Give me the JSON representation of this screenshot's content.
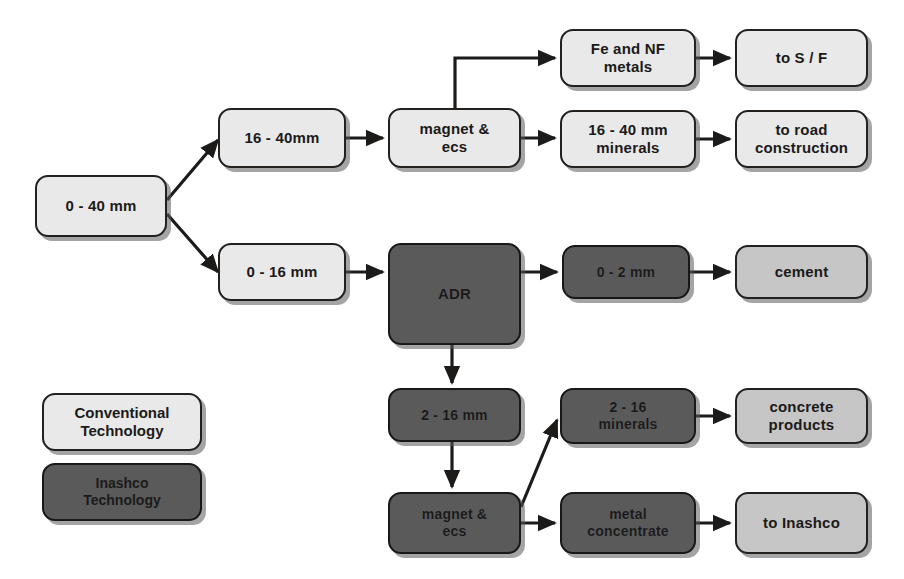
{
  "diagram": {
    "colors": {
      "light_fill": "#e9e9e9",
      "midlight_fill": "#c6c6c6",
      "dark_fill": "#5a5a5a",
      "stroke": "#23201e",
      "background": "#ffffff"
    },
    "nodes": [
      {
        "id": "feed",
        "label": "0 - 40 mm",
        "style": "light",
        "x": 35,
        "y": 175,
        "w": 132,
        "h": 62,
        "font": 15
      },
      {
        "id": "frac_16_40",
        "label": "16 - 40mm",
        "style": "light",
        "x": 218,
        "y": 108,
        "w": 128,
        "h": 60,
        "font": 15
      },
      {
        "id": "magnet_ecs_top",
        "label": "magnet &\necs",
        "style": "light",
        "x": 388,
        "y": 108,
        "w": 133,
        "h": 60,
        "font": 15
      },
      {
        "id": "fe_nf_metals",
        "label": "Fe and NF\nmetals",
        "style": "light",
        "x": 560,
        "y": 29,
        "w": 136,
        "h": 58,
        "font": 15
      },
      {
        "id": "to_sf",
        "label": "to S / F",
        "style": "light",
        "x": 735,
        "y": 29,
        "w": 133,
        "h": 58,
        "font": 15
      },
      {
        "id": "min_16_40",
        "label": "16 - 40 mm\nminerals",
        "style": "light",
        "x": 560,
        "y": 110,
        "w": 136,
        "h": 58,
        "font": 15
      },
      {
        "id": "to_road",
        "label": "to road\nconstruction",
        "style": "light",
        "x": 735,
        "y": 110,
        "w": 133,
        "h": 58,
        "font": 15
      },
      {
        "id": "frac_0_16",
        "label": "0 - 16 mm",
        "style": "light",
        "x": 218,
        "y": 243,
        "w": 128,
        "h": 58,
        "font": 15
      },
      {
        "id": "adr",
        "label": "ADR",
        "style": "dark",
        "x": 388,
        "y": 243,
        "w": 133,
        "h": 102,
        "font": 15
      },
      {
        "id": "frac_0_2",
        "label": "0 - 2 mm",
        "style": "dark",
        "x": 562,
        "y": 245,
        "w": 128,
        "h": 54,
        "font": 14
      },
      {
        "id": "cement",
        "label": "cement",
        "style": "midlight",
        "x": 735,
        "y": 245,
        "w": 133,
        "h": 54,
        "font": 15
      },
      {
        "id": "frac_2_16",
        "label": "2 - 16 mm",
        "style": "dark",
        "x": 388,
        "y": 388,
        "w": 133,
        "h": 54,
        "font": 14
      },
      {
        "id": "magnet_ecs_bot",
        "label": "magnet &\necs",
        "style": "dark",
        "x": 388,
        "y": 492,
        "w": 133,
        "h": 62,
        "font": 14
      },
      {
        "id": "min_2_16",
        "label": "2 - 16\nminerals",
        "style": "dark",
        "x": 560,
        "y": 388,
        "w": 136,
        "h": 56,
        "font": 14
      },
      {
        "id": "concrete",
        "label": "concrete\nproducts",
        "style": "midlight",
        "x": 735,
        "y": 388,
        "w": 133,
        "h": 56,
        "font": 15
      },
      {
        "id": "metal_conc",
        "label": "metal\nconcentrate",
        "style": "dark",
        "x": 560,
        "y": 492,
        "w": 136,
        "h": 62,
        "font": 14
      },
      {
        "id": "to_inashco",
        "label": "to Inashco",
        "style": "midlight",
        "x": 735,
        "y": 492,
        "w": 133,
        "h": 62,
        "font": 15
      }
    ],
    "legend": [
      {
        "id": "legend-conventional",
        "label": "Conventional\nTechnology",
        "style": "light",
        "x": 42,
        "y": 393,
        "w": 160,
        "h": 58,
        "font": 15
      },
      {
        "id": "legend-inashco",
        "label": "Inashco\nTechnology",
        "style": "dark",
        "x": 42,
        "y": 463,
        "w": 160,
        "h": 58,
        "font": 14
      }
    ],
    "connectors": [
      {
        "id": "feed-to-16-40",
        "points": "167,200 218,140",
        "arrow": true
      },
      {
        "id": "feed-to-0-16",
        "points": "167,214 218,272",
        "arrow": true
      },
      {
        "id": "16-40-to-magnet",
        "points": "346,138 383,138",
        "arrow": true
      },
      {
        "id": "magnet-to-fe-nf",
        "points": "455,108 455,58 555,58",
        "arrow": true
      },
      {
        "id": "magnet-to-minerals",
        "points": "521,138 555,138",
        "arrow": true
      },
      {
        "id": "fe-nf-to-sf",
        "points": "696,58 730,58",
        "arrow": true
      },
      {
        "id": "minerals-to-road",
        "points": "696,139 730,139",
        "arrow": true
      },
      {
        "id": "0-16-to-adr",
        "points": "346,272 383,272",
        "arrow": true
      },
      {
        "id": "adr-to-0-2",
        "points": "521,272 557,272",
        "arrow": true
      },
      {
        "id": "0-2-to-cement",
        "points": "690,272 730,272",
        "arrow": true
      },
      {
        "id": "adr-to-2-16",
        "points": "452,345 452,383",
        "arrow": true
      },
      {
        "id": "2-16-to-magnet-bot",
        "points": "452,442 452,487",
        "arrow": true
      },
      {
        "id": "magnet-bot-to-min-2-16",
        "points": "521,507 557,420",
        "arrow": true
      },
      {
        "id": "magnet-bot-to-metal-conc",
        "points": "521,523 555,523",
        "arrow": true
      },
      {
        "id": "min-2-16-to-concrete",
        "points": "696,416 730,416",
        "arrow": true
      },
      {
        "id": "metal-conc-to-inashco",
        "points": "696,523 730,523",
        "arrow": true
      }
    ]
  }
}
